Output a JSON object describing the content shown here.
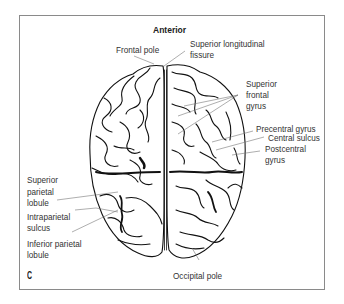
{
  "figure": {
    "panel_letter": "C",
    "orientation_label": "Anterior",
    "colors": {
      "frame": "#8a8a8a",
      "ink": "#111111",
      "leader": "#777777",
      "text": "#333333"
    }
  },
  "labels": {
    "frontal_pole": "Frontal pole",
    "superior_longitudinal_fissure": [
      "Superior longitudinal",
      "fissure"
    ],
    "superior_frontal_gyrus": [
      "Superior",
      "frontal",
      "gyrus"
    ],
    "precentral_gyrus": "Precentral gyrus",
    "central_sulcus": "Central sulcus",
    "postcentral_gyrus": [
      "Postcentral",
      "gyrus"
    ],
    "superior_parietal_lobule": [
      "Superior",
      "parietal",
      "lobule"
    ],
    "intraparietal_sulcus": [
      "Intraparietal",
      "sulcus"
    ],
    "inferior_parietal_lobule": [
      "Inferior parietal",
      "lobule"
    ],
    "occipital_pole": "Occipital pole"
  }
}
